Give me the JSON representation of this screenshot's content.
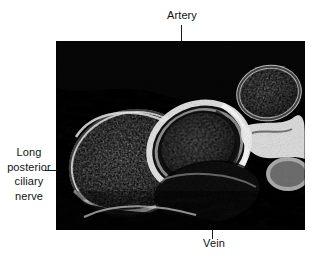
{
  "figure": {
    "kind": "histology-micrograph",
    "caption_labels": {
      "artery": "Artery",
      "vein": "Vein",
      "nerve_line_1": "Long",
      "nerve_line_2": "posterior",
      "nerve_line_3": "ciliary",
      "nerve_line_4": "nerve"
    },
    "colors": {
      "background": "#ffffff",
      "text": "#111111",
      "leader_line": "#1a1a1a",
      "tissue_dark": "#0a0a0a",
      "tissue_mid": "#6e6e6e",
      "tissue_light": "#d8d8d8",
      "tissue_highlight": "#f2f2f2"
    },
    "plate": {
      "left": 56,
      "top": 41,
      "width": 249,
      "height": 189
    },
    "structures": [
      {
        "name": "long-posterior-ciliary-nerve",
        "label": "Long posterior ciliary nerve",
        "shape": "large-granular-oval",
        "position": "left-center"
      },
      {
        "name": "artery",
        "label": "Artery",
        "shape": "oval-with-bright-wall",
        "position": "center"
      },
      {
        "name": "vein",
        "label": "Vein",
        "shape": "dark-collapsed-lumen",
        "position": "bottom-center"
      },
      {
        "name": "secondary-nerve-bundle",
        "label": "",
        "shape": "granular-oval",
        "position": "upper-right"
      }
    ]
  }
}
